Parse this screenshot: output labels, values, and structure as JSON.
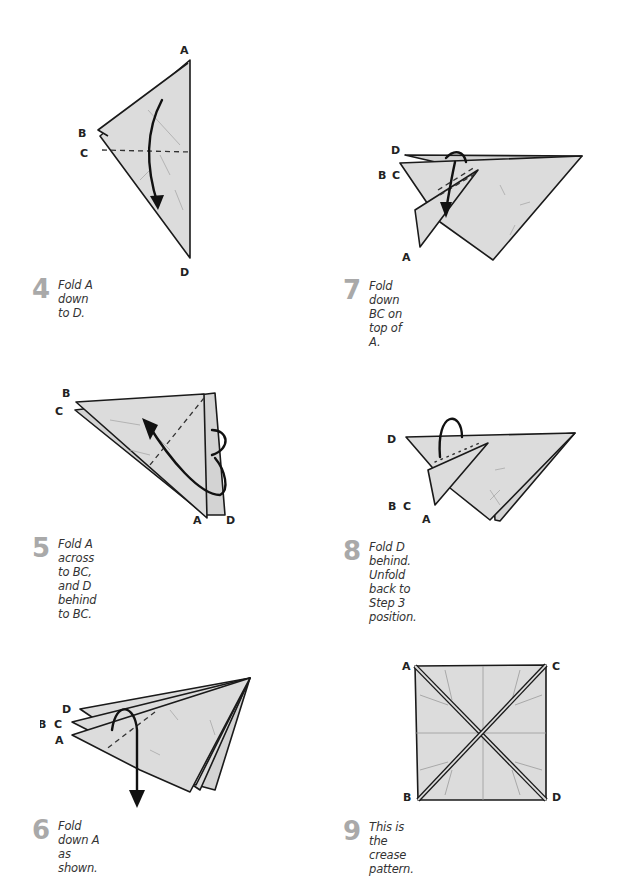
{
  "page": {
    "background": "#ffffff",
    "step_number_color": "#a9a9a9",
    "paper_fill": "#dcdcdc",
    "line_color": "#1a1a1a"
  },
  "steps": [
    {
      "number": "4",
      "instruction": "Fold A down to D.",
      "labels": {
        "A": "A",
        "B": "B",
        "C": "C",
        "D": "D"
      }
    },
    {
      "number": "5",
      "instruction": "Fold A across to BC, and D behind to BC.",
      "labels": {
        "A": "A",
        "B": "B",
        "C": "C",
        "D": "D"
      }
    },
    {
      "number": "6",
      "instruction": "Fold down A as shown.",
      "labels": {
        "A": "A",
        "B": "B",
        "C": "C",
        "D": "D"
      }
    },
    {
      "number": "7",
      "instruction": "Fold down BC on top of A.",
      "labels": {
        "A": "A",
        "B": "B",
        "C": "C",
        "D": "D"
      }
    },
    {
      "number": "8",
      "instruction": "Fold D behind. Unfold back to Step 3 position.",
      "labels": {
        "A": "A",
        "B": "B",
        "C": "C",
        "D": "D"
      }
    },
    {
      "number": "9",
      "instruction": "This is the crease pattern.",
      "labels": {
        "A": "A",
        "B": "B",
        "C": "C",
        "D": "D"
      }
    }
  ]
}
